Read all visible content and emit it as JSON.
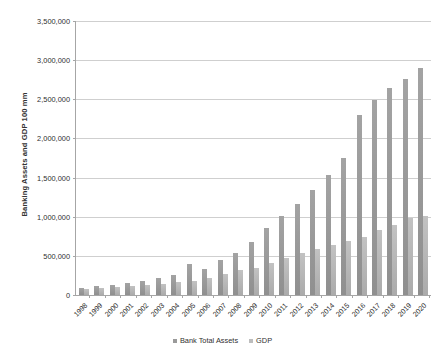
{
  "chart_data": {
    "type": "bar",
    "title": "",
    "xlabel": "",
    "ylabel": "Banking Assets and GDP 100 mm",
    "ylim": [
      0,
      3500000
    ],
    "ytick_step": 500000,
    "grid": true,
    "legend_position": "bottom",
    "categories": [
      "1998",
      "1999",
      "2000",
      "2001",
      "2002",
      "2003",
      "2004",
      "2005",
      "2006",
      "2007",
      "2008",
      "2009",
      "2010",
      "2011",
      "2012",
      "2013",
      "2014",
      "2015",
      "2016",
      "2017",
      "2018",
      "2019",
      "2020"
    ],
    "series": [
      {
        "name": "Bank Total Assets",
        "color": "#9a9a9a",
        "values": [
          95000,
          110000,
          130000,
          155000,
          180000,
          215000,
          250000,
          390000,
          330000,
          450000,
          540000,
          680000,
          860000,
          1010000,
          1160000,
          1340000,
          1530000,
          1750000,
          2300000,
          2490000,
          2640000,
          2760000,
          2900000
        ]
      },
      {
        "name": "GDP",
        "color": "#bdbdbd",
        "values": [
          80000,
          90000,
          100000,
          110000,
          125000,
          140000,
          160000,
          185000,
          215000,
          270000,
          320000,
          345000,
          410000,
          475000,
          540000,
          590000,
          645000,
          690000,
          745000,
          830000,
          900000,
          990000,
          1015000
        ]
      }
    ],
    "ytick_labels": [
      "0",
      "500,000",
      "1,000,000",
      "1,500,000",
      "2,000,000",
      "2,500,000",
      "3,000,000",
      "3,500,000"
    ]
  }
}
